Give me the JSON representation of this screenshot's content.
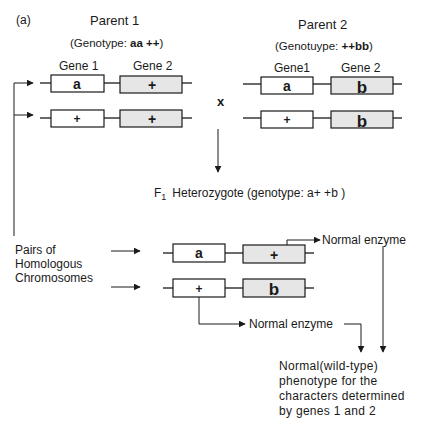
{
  "panel_label": "(a)",
  "parent1": {
    "title": "Parent 1",
    "genotype_prefix": "(Genotype: ",
    "genotype_value": "aa ++",
    "genotype_suffix": ")",
    "gene1_label": "Gene 1",
    "gene2_label": "Gene 2",
    "chromosome1": {
      "gene1": "a",
      "gene2": "+"
    },
    "chromosome2": {
      "gene1": "+",
      "gene2": "+"
    }
  },
  "parent2": {
    "title": "Parent 2",
    "genotype_prefix": "(Genotuype: ",
    "genotype_value": "++bb",
    "genotype_suffix": ")",
    "gene1_label": "Gene1",
    "gene2_label": "Gene 2",
    "chromosome1": {
      "gene1": "a",
      "gene2": "b"
    },
    "chromosome2": {
      "gene1": "+",
      "gene2": "b"
    }
  },
  "cross_symbol": "x",
  "f1": {
    "label_f": "F",
    "label_sub": "1",
    "label_text": "Heterozygote (genotype: a+ +b )",
    "chromosome1": {
      "gene1": "a",
      "gene2": "+"
    },
    "chromosome2": {
      "gene1": "+",
      "gene2": "b"
    }
  },
  "homologous_label": [
    "Pairs  of",
    "Homologous",
    "Chromosomes"
  ],
  "product_top": "Normal  enzyme",
  "product_bottom": "Normal enzyme",
  "phenotype_lines": [
    "Normal(wild-type)",
    "phenotype  for  the",
    "characters  determined",
    "by genes 1 and 2"
  ],
  "colors": {
    "ink": "#1a1a1a",
    "gene2_fill": "#e6e6e6",
    "gene1_fill": "#ffffff"
  }
}
